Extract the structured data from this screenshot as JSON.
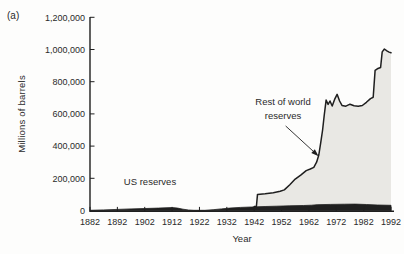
{
  "figure": {
    "panel_label": "(a)"
  },
  "colors": {
    "background": "#fdfdfc",
    "area_fill": "#e9e8e4",
    "ink": "#1f1f1f",
    "text": "#2a2a2a"
  },
  "chart_data": {
    "type": "area",
    "title": "",
    "xlabel": "Year",
    "ylabel": "Millions of barrels",
    "xlim": [
      1882,
      1992
    ],
    "ylim": [
      0,
      1200000
    ],
    "grid": false,
    "legend": "inline annotations with arrow",
    "xticks": [
      1882,
      1892,
      1902,
      1912,
      1922,
      1932,
      1942,
      1952,
      1962,
      1972,
      1982,
      1992
    ],
    "yticks": [
      0,
      200000,
      400000,
      600000,
      800000,
      1000000,
      1200000
    ],
    "ytick_labels": [
      "0",
      "200,000",
      "400,000",
      "600,000",
      "800,000",
      "1,000,000",
      "1,200,000"
    ],
    "series": [
      {
        "name": "US reserves",
        "style": "solid-black-band",
        "color": "#1f1f1f",
        "points": [
          [
            1882,
            1000
          ],
          [
            1887,
            4000
          ],
          [
            1892,
            7000
          ],
          [
            1897,
            10000
          ],
          [
            1902,
            12500
          ],
          [
            1907,
            15000
          ],
          [
            1912,
            18000
          ],
          [
            1914,
            15000
          ],
          [
            1916,
            8000
          ],
          [
            1918,
            3000
          ],
          [
            1920,
            1500
          ],
          [
            1924,
            1500
          ],
          [
            1927,
            5000
          ],
          [
            1930,
            10000
          ],
          [
            1933,
            15000
          ],
          [
            1937,
            19000
          ],
          [
            1941,
            22000
          ],
          [
            1946,
            25000
          ],
          [
            1950,
            27000
          ],
          [
            1955,
            29000
          ],
          [
            1960,
            31000
          ],
          [
            1963,
            33000
          ],
          [
            1965,
            36000
          ],
          [
            1970,
            38000
          ],
          [
            1975,
            39000
          ],
          [
            1979,
            40000
          ],
          [
            1983,
            37000
          ],
          [
            1987,
            34000
          ],
          [
            1992,
            32000
          ]
        ]
      },
      {
        "name": "Rest of world reserves",
        "style": "gray-area-black-outline",
        "fill": "#e9e8e4",
        "stroke": "#1f1f1f",
        "points": [
          [
            1942,
            24000
          ],
          [
            1942.8,
            25000
          ],
          [
            1943.2,
            100000
          ],
          [
            1946,
            104000
          ],
          [
            1949,
            110000
          ],
          [
            1951.5,
            120000
          ],
          [
            1953,
            128000
          ],
          [
            1955,
            160000
          ],
          [
            1957,
            195000
          ],
          [
            1959,
            220000
          ],
          [
            1961,
            248000
          ],
          [
            1962.5,
            258000
          ],
          [
            1963.8,
            268000
          ],
          [
            1964.8,
            300000
          ],
          [
            1965.6,
            345000
          ],
          [
            1966.3,
            420000
          ],
          [
            1967,
            500000
          ],
          [
            1967.6,
            590000
          ],
          [
            1968.3,
            686000
          ],
          [
            1969,
            659000
          ],
          [
            1969.7,
            680000
          ],
          [
            1970.5,
            649000
          ],
          [
            1971.4,
            690000
          ],
          [
            1972.3,
            722000
          ],
          [
            1973.2,
            680000
          ],
          [
            1974.1,
            653000
          ],
          [
            1975.5,
            648000
          ],
          [
            1977,
            660000
          ],
          [
            1978.5,
            650000
          ],
          [
            1980,
            648000
          ],
          [
            1981.5,
            652000
          ],
          [
            1983,
            672000
          ],
          [
            1984.5,
            695000
          ],
          [
            1985.5,
            703000
          ],
          [
            1986.2,
            870000
          ],
          [
            1987,
            880000
          ],
          [
            1988.2,
            888000
          ],
          [
            1988.8,
            985000
          ],
          [
            1989.6,
            1003000
          ],
          [
            1990.5,
            992000
          ],
          [
            1991.3,
            984000
          ],
          [
            1992,
            980000
          ]
        ]
      }
    ],
    "annotations": [
      {
        "label": "US reserves",
        "line1": "US reserves"
      },
      {
        "label": "Rest of world reserves",
        "line1": "Rest of world",
        "line2": "reserves",
        "arrow_from_year": 1953.5,
        "arrow_from_value": 525000,
        "arrow_to_year": 1964.6,
        "arrow_to_value": 352000
      }
    ]
  }
}
